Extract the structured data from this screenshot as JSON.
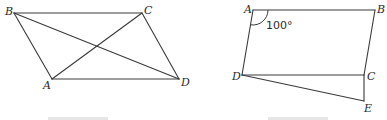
{
  "figures": [
    {
      "id": "left",
      "shape": "parallelogram-with-diagonals",
      "vertices": {
        "B": {
          "label": "B",
          "x": 14,
          "y": 13
        },
        "C": {
          "label": "C",
          "x": 142,
          "y": 13
        },
        "A": {
          "label": "A",
          "x": 52,
          "y": 79
        },
        "D": {
          "label": "D",
          "x": 179,
          "y": 79
        }
      },
      "edges": [
        [
          "B",
          "C"
        ],
        [
          "C",
          "D"
        ],
        [
          "D",
          "A"
        ],
        [
          "A",
          "B"
        ],
        [
          "A",
          "C"
        ],
        [
          "B",
          "D"
        ]
      ],
      "caption": "Fig. 1 (truncated)"
    },
    {
      "id": "right",
      "shape": "parallelogram-with-extension",
      "vertices": {
        "A": {
          "label": "A",
          "x": 253,
          "y": 10
        },
        "B": {
          "label": "B",
          "x": 375,
          "y": 10
        },
        "C": {
          "label": "C",
          "x": 364,
          "y": 75
        },
        "D": {
          "label": "D",
          "x": 242,
          "y": 75
        },
        "E": {
          "label": "E",
          "x": 364,
          "y": 101
        }
      },
      "edges": [
        [
          "A",
          "B"
        ],
        [
          "B",
          "C"
        ],
        [
          "C",
          "D"
        ],
        [
          "D",
          "A"
        ],
        [
          "C",
          "E"
        ],
        [
          "D",
          "E"
        ]
      ],
      "angle": {
        "vertex": "A",
        "value": "100°"
      },
      "caption": "Fig. 2 (truncated)"
    }
  ],
  "labels": {
    "left_B": "B",
    "left_C": "C",
    "left_A": "A",
    "left_D": "D",
    "right_A": "A",
    "right_B": "B",
    "right_C": "C",
    "right_D": "D",
    "right_E": "E",
    "right_angle_A": "100°"
  }
}
